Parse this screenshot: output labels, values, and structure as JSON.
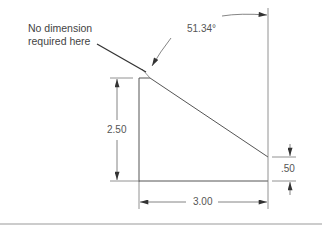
{
  "drawing": {
    "note": {
      "line1": "No dimension",
      "line2": "required here"
    },
    "dimensions": {
      "angle": "51.34°",
      "height": "2.50",
      "width": "3.00",
      "offset": ".50"
    },
    "colors": {
      "line": "#555555",
      "text": "#444444",
      "background": "#ffffff"
    }
  }
}
